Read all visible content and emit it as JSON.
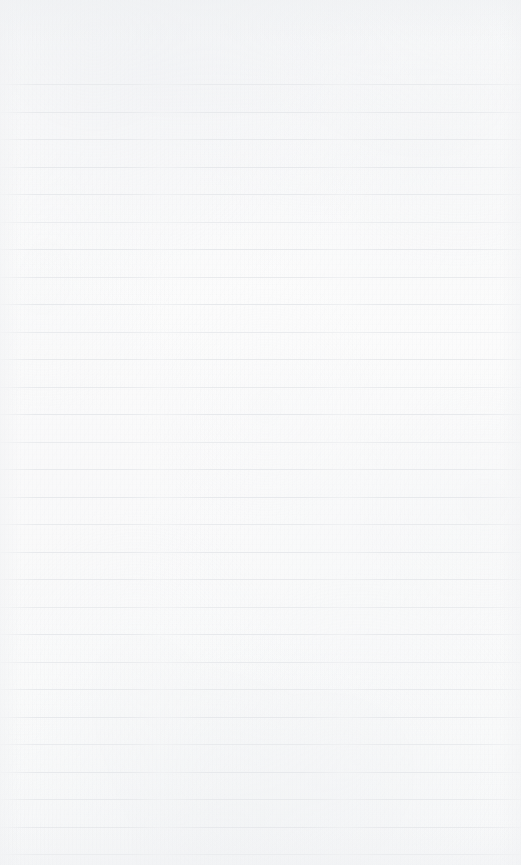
{
  "document": {
    "kind": "ruled-notebook-paper",
    "description": "Blank lined notebook page, scanned",
    "content_text": "",
    "width_px": 521,
    "height_px": 865
  },
  "paper": {
    "background_color": "#fbfbfb",
    "texture": "scanned-paper-grain",
    "has_margin_rule": false,
    "has_punch_holes": false
  },
  "rules": {
    "color": "#e7e9ec",
    "thickness_px": 1,
    "spacing_px": 27.5,
    "first_line_y_px": 84,
    "count": 29,
    "full_bleed": true,
    "positions_y_px": [
      84,
      111.5,
      139,
      166.5,
      194,
      221.5,
      249,
      276.5,
      304,
      331.5,
      359,
      386.5,
      414,
      441.5,
      469,
      496.5,
      524,
      551.5,
      579,
      606.5,
      634,
      661.5,
      689,
      716.5,
      744,
      771.5,
      799,
      826.5,
      854
    ]
  },
  "header_margin": {
    "height_px": 84,
    "content_text": ""
  }
}
